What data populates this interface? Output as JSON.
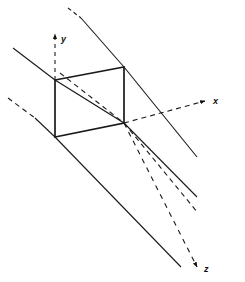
{
  "figure": {
    "name": "3d-coordinate-plane-projection-diagram",
    "type": "line-diagram",
    "width": 245,
    "height": 282,
    "background_color": "#ffffff",
    "stroke_color": "#1a1a1a"
  },
  "axes": [
    {
      "id": "y",
      "label": "y",
      "label_x": 61,
      "label_y": 40,
      "style": "dashed",
      "arrow": "up",
      "from": {
        "x": 55,
        "y": 80
      },
      "to": {
        "x": 55,
        "y": 31
      }
    },
    {
      "id": "x",
      "label": "x",
      "label_x": 214,
      "label_y": 105,
      "style": "dashed",
      "arrow": "right",
      "from": {
        "x": 124,
        "y": 123
      },
      "to": {
        "x": 206,
        "y": 101
      }
    },
    {
      "id": "z",
      "label": "z",
      "label_x": 203,
      "label_y": 272,
      "style": "dashed",
      "arrow": "down-right",
      "from": {
        "x": 124,
        "y": 123
      },
      "to": {
        "x": 196,
        "y": 266
      }
    }
  ],
  "plane": {
    "name": "rectangular-plane-element",
    "style": "solid",
    "corners": [
      {
        "x": 55,
        "y": 80
      },
      {
        "x": 124,
        "y": 67
      },
      {
        "x": 124,
        "y": 123
      },
      {
        "x": 55,
        "y": 137
      }
    ]
  },
  "rays": [
    {
      "id": "ray-upper-left-solid",
      "style": "solid",
      "from": {
        "x": 13,
        "y": 48
      },
      "to": {
        "x": 55,
        "y": 80
      }
    },
    {
      "id": "ray-top-dashed-stub",
      "style": "dashed",
      "from": {
        "x": 68,
        "y": 8
      },
      "to": {
        "x": 80,
        "y": 17
      }
    },
    {
      "id": "ray-top-to-plane-solid",
      "style": "solid",
      "from": {
        "x": 80,
        "y": 17
      },
      "to": {
        "x": 124,
        "y": 67
      }
    },
    {
      "id": "ray-through-plane-top-right",
      "style": "solid",
      "from": {
        "x": 124,
        "y": 67
      },
      "to": {
        "x": 196,
        "y": 156
      }
    },
    {
      "id": "ray-interior-dashed",
      "style": "dashed",
      "from": {
        "x": 60,
        "y": 73
      },
      "to": {
        "x": 124,
        "y": 123
      }
    },
    {
      "id": "ray-interior-dashed-extension",
      "style": "dashed",
      "from": {
        "x": 124,
        "y": 123
      },
      "to": {
        "x": 196,
        "y": 212
      }
    },
    {
      "id": "ray-plane-diagonal-solid",
      "style": "solid",
      "from": {
        "x": 55,
        "y": 80
      },
      "to": {
        "x": 124,
        "y": 123
      }
    },
    {
      "id": "ray-lower-left-dashed",
      "style": "dashed",
      "from": {
        "x": 8,
        "y": 98
      },
      "to": {
        "x": 34,
        "y": 118
      }
    },
    {
      "id": "ray-lower-left-solid",
      "style": "solid",
      "from": {
        "x": 34,
        "y": 118
      },
      "to": {
        "x": 55,
        "y": 137
      }
    },
    {
      "id": "ray-bottom-long-solid",
      "style": "solid",
      "from": {
        "x": 55,
        "y": 137
      },
      "to": {
        "x": 180,
        "y": 266
      }
    },
    {
      "id": "ray-mid-long-solid",
      "style": "solid",
      "from": {
        "x": 124,
        "y": 123
      },
      "to": {
        "x": 196,
        "y": 196
      }
    }
  ],
  "labels": {
    "x_axis": "x",
    "y_axis": "y",
    "z_axis": "z"
  }
}
